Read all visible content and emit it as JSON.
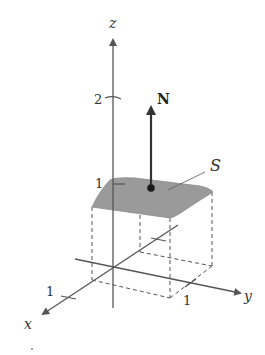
{
  "figure": {
    "axes": {
      "x_label": "x",
      "y_label": "y",
      "z_label": "z"
    },
    "ticks": {
      "z_1": "1",
      "z_2": "2",
      "x_1": "1",
      "y_1": "1"
    },
    "surface": {
      "label": "S",
      "fill_color": "#9a9a9a"
    },
    "normal_vector": {
      "label": "N",
      "color": "#444444"
    }
  }
}
